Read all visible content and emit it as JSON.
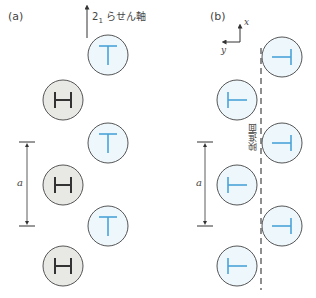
{
  "panels": [
    {
      "id": "a",
      "label": "(a)",
      "axis_label_main": "2",
      "axis_label_sub": "1",
      "axis_label_rest": " らせん軸",
      "dimension_label": "a",
      "molecules": [
        {
          "type": "T",
          "orientation": "up",
          "cx": 108,
          "cy": 55
        },
        {
          "type": "H",
          "orientation": "up",
          "cx": 63,
          "cy": 100
        },
        {
          "type": "T",
          "orientation": "up",
          "cx": 108,
          "cy": 143
        },
        {
          "type": "H",
          "orientation": "up",
          "cx": 63,
          "cy": 185
        },
        {
          "type": "T",
          "orientation": "up",
          "cx": 108,
          "cy": 226
        },
        {
          "type": "H",
          "orientation": "up",
          "cx": 63,
          "cy": 266
        }
      ]
    },
    {
      "id": "b",
      "label": "(b)",
      "x_axis_label": "x",
      "y_axis_label": "y",
      "glide_plane_label": "映進面",
      "dimension_label": "a",
      "molecules": [
        {
          "type": "T",
          "orientation": "right",
          "cx": 282,
          "cy": 57
        },
        {
          "type": "T",
          "orientation": "left",
          "cx": 237,
          "cy": 100
        },
        {
          "type": "T",
          "orientation": "right",
          "cx": 282,
          "cy": 143
        },
        {
          "type": "T",
          "orientation": "left",
          "cx": 237,
          "cy": 185
        },
        {
          "type": "T",
          "orientation": "right",
          "cx": 282,
          "cy": 226
        },
        {
          "type": "T",
          "orientation": "left",
          "cx": 237,
          "cy": 266
        }
      ]
    }
  ],
  "colors": {
    "t_fill": "#eef7fc",
    "t_glyph": "#4aa3d8",
    "h_fill": "#e8e8e5",
    "h_glyph": "#333333",
    "stroke": "#555555"
  }
}
